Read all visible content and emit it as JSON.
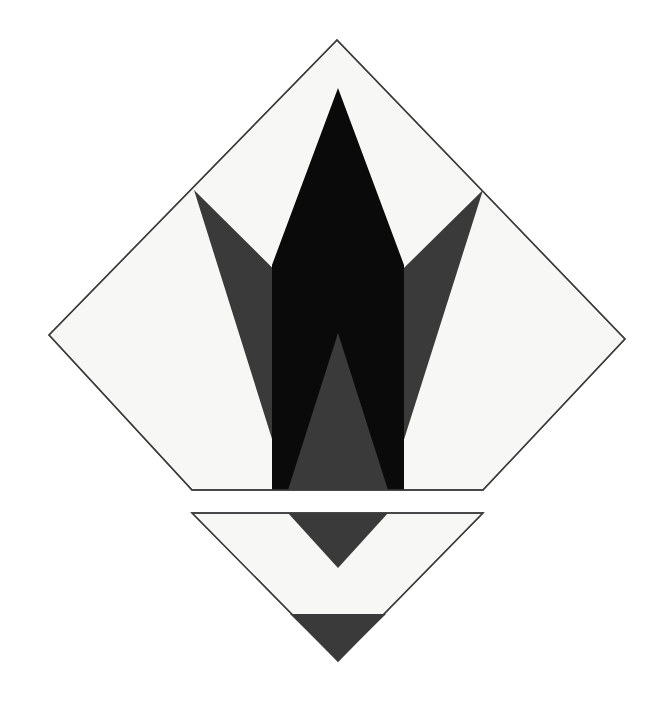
{
  "artwork": {
    "title": "Abstract Geometric Composition",
    "medium": "flat-vector-shapes",
    "canvas": {
      "width": 671,
      "height": 716,
      "background_color": "#ffffff"
    },
    "palette": {
      "paper_white": "#f7f7f5",
      "page_white": "#ffffff",
      "ink_black": "#0a0a0a",
      "slate_gray": "#3a3a3a",
      "outline": "#3c3c3c"
    },
    "description": "A large white diamond, truncated along a horizontal bottom edge, containing a tall black spire and a dark gray V-shaped chevron; beneath it a separate inverted white triangle holds a gray downward wedge and a gray base band."
  },
  "shapes": {
    "upper_diamond": {
      "name": "truncated-diamond",
      "fill": "#f7f7f5",
      "stroke": "#3c3c3c",
      "stroke_width": 1.4,
      "points": "337,40 625,339 483,490 192,490 49,335"
    },
    "black_spire": {
      "name": "black-spire",
      "fill": "#0a0a0a",
      "points": "338,88 404,265 404,490 388,490 338,333 288,490 272,490 272,265"
    },
    "gray_chevron": {
      "name": "gray-chevron",
      "fill": "#3a3a3a",
      "points": "194,190 338,333 483,190 388,490 288,490"
    },
    "lower_triangle": {
      "name": "lower-inverted-triangle",
      "fill": "#f7f7f5",
      "stroke": "#3c3c3c",
      "stroke_width": 1.4,
      "points": "192,513 483,513 338,661"
    },
    "lower_wedge": {
      "name": "gray-inner-wedge",
      "fill": "#3a3a3a",
      "points": "288,513 388,513 338,568"
    },
    "lower_band": {
      "name": "gray-base-band",
      "fill": "#3a3a3a",
      "points": "290,614 386,614 338,661"
    }
  },
  "geometry_notes": {
    "diamond_apex": "337, 40",
    "diamond_left_vertex": "49, 335",
    "diamond_right_vertex": "625, 339",
    "diamond_cut_line_y": 490,
    "spire_apex": "338, 88",
    "chevron_notch": "338, 333",
    "lower_triangle_top_y": 513,
    "lower_triangle_apex": "338, 661"
  }
}
